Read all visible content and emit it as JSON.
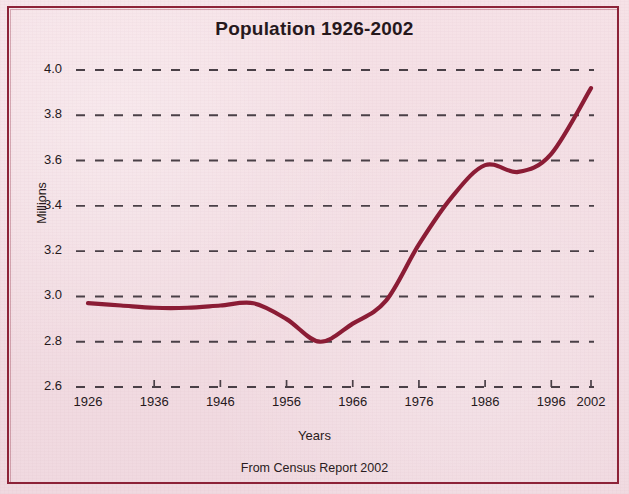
{
  "chart_data": {
    "type": "line",
    "title": "Population 1926-2002",
    "xlabel": "Years",
    "ylabel": "Millions",
    "source_note": "From Census Report 2002",
    "grid": "horizontal-dashed",
    "legend": "none",
    "xlim": [
      1926,
      2002
    ],
    "ylim": [
      2.6,
      4.0
    ],
    "ytick_labels": [
      "4.0",
      "3.8",
      "3.6",
      "3.4",
      "3.2",
      "3.0",
      "2.8",
      "2.6"
    ],
    "ytick_values": [
      4.0,
      3.8,
      3.6,
      3.4,
      3.2,
      3.0,
      2.8,
      2.6
    ],
    "xtick_labels": [
      "1926",
      "1936",
      "1946",
      "1956",
      "1966",
      "1976",
      "1986",
      "1996",
      "2002"
    ],
    "xtick_values": [
      1926,
      1936,
      1946,
      1956,
      1966,
      1976,
      1986,
      1996,
      2002
    ],
    "series": [
      {
        "name": "Population",
        "color": "#8b1c35",
        "x": [
          1926,
          1931,
          1936,
          1941,
          1946,
          1951,
          1956,
          1961,
          1966,
          1971,
          1976,
          1981,
          1986,
          1991,
          1996,
          2002
        ],
        "values": [
          2.97,
          2.96,
          2.95,
          2.95,
          2.96,
          2.97,
          2.9,
          2.8,
          2.88,
          2.98,
          3.23,
          3.44,
          3.58,
          3.55,
          3.63,
          3.92
        ]
      }
    ]
  },
  "figure": {
    "background_color": "#f3dee4",
    "frame_color": "#8d2338",
    "text_color": "#26181c",
    "grid_color": "#4a4047"
  }
}
